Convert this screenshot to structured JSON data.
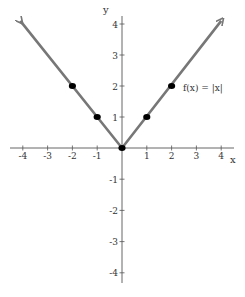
{
  "chart_data": {
    "type": "line",
    "title": "",
    "function_label": "f(x) = |x|",
    "xlabel": "x",
    "ylabel": "y",
    "xlim": [
      -4.5,
      4.5
    ],
    "ylim": [
      -4.3,
      4.3
    ],
    "x_ticks": [
      -4,
      -3,
      -2,
      -1,
      1,
      2,
      3,
      4
    ],
    "y_ticks": [
      -4,
      -3,
      -2,
      -1,
      1,
      2,
      3,
      4
    ],
    "x_tick_labels": [
      "-4",
      "-3",
      "-2",
      "-1",
      "1",
      "2",
      "3",
      "4"
    ],
    "y_tick_labels": [
      "-4",
      "-3",
      "-2",
      "-1",
      "1",
      "2",
      "3",
      "4"
    ],
    "grid": false,
    "legend": null,
    "series": [
      {
        "name": "f(x) = |x|",
        "line": {
          "x": [
            -4.1,
            0,
            4.0
          ],
          "y": [
            4.1,
            0,
            4.1
          ],
          "arrows": "both",
          "color": "#777777"
        },
        "points": {
          "x": [
            -2,
            -1,
            0,
            1,
            2
          ],
          "y": [
            2,
            1,
            0,
            1,
            2
          ],
          "color": "#000000"
        }
      }
    ]
  }
}
